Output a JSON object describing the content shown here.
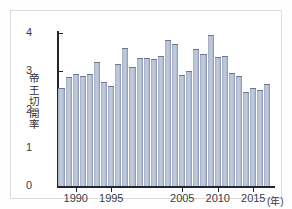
{
  "chart_data": {
    "type": "bar",
    "title": "",
    "xlabel": "(年)",
    "ylabel": "帝王切開率",
    "ylim": [
      0,
      4
    ],
    "yticks": [
      "0",
      "1",
      "2",
      "3",
      "4"
    ],
    "ytick_values": [
      0,
      1,
      2,
      3,
      4
    ],
    "xtick_labels": [
      "1990",
      "1995",
      "2005",
      "2010",
      "2015"
    ],
    "xtick_years": [
      1990,
      1995,
      2005,
      2010,
      2015
    ],
    "grid": false,
    "legend": null,
    "categories": [
      "1988",
      "1989",
      "1990",
      "1991",
      "1992",
      "1993",
      "1994",
      "1995",
      "1996",
      "1997",
      "1998",
      "1999",
      "2000",
      "2001",
      "2002",
      "2003",
      "2004",
      "2005",
      "2006",
      "2007",
      "2008",
      "2009",
      "2010",
      "2011",
      "2012",
      "2013",
      "2014",
      "2015",
      "2016",
      "2017"
    ],
    "values": [
      2.55,
      2.84,
      2.94,
      2.88,
      2.92,
      3.25,
      2.73,
      2.61,
      3.19,
      3.6,
      3.11,
      3.35,
      3.35,
      3.31,
      3.41,
      3.83,
      3.7,
      2.9,
      3.0,
      3.58,
      3.44,
      3.95,
      3.37,
      3.41,
      2.95,
      2.88,
      2.47,
      2.55,
      2.5,
      2.68
    ],
    "bar_color": "#b9c3d6",
    "bar_edge_color": "#6e7894",
    "axis_color": "#22252b",
    "background_color": "#ffffff",
    "note_values_tail": [
      3.1
    ]
  },
  "figure": {
    "border_color": "#dcdcdc",
    "unit_label": "(年)"
  }
}
